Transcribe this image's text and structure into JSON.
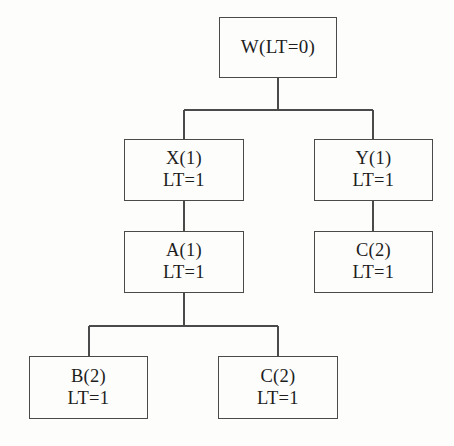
{
  "diagram": {
    "type": "tree",
    "title": "",
    "background_color": "#fdfdfc",
    "line_color": "#4a4a4a",
    "text_color": "#1d1d1d",
    "nodes": [
      {
        "id": "W",
        "line1": "W(LT=0)",
        "line2": "",
        "row": 0,
        "box": {
          "x": 219,
          "y": 17,
          "w": 118,
          "h": 61
        }
      },
      {
        "id": "X",
        "line1": "X(1)",
        "line2": "LT=1",
        "row": 1,
        "box": {
          "x": 124,
          "y": 139,
          "w": 120,
          "h": 62
        }
      },
      {
        "id": "Y",
        "line1": "Y(1)",
        "line2": "LT=1",
        "row": 1,
        "box": {
          "x": 314,
          "y": 139,
          "w": 119,
          "h": 62
        }
      },
      {
        "id": "A",
        "line1": "A(1)",
        "line2": "LT=1",
        "row": 2,
        "box": {
          "x": 124,
          "y": 231,
          "w": 120,
          "h": 62
        }
      },
      {
        "id": "C-right",
        "line1": "C(2)",
        "line2": "LT=1",
        "row": 2,
        "box": {
          "x": 314,
          "y": 231,
          "w": 119,
          "h": 62
        }
      },
      {
        "id": "B",
        "line1": "B(2)",
        "line2": "LT=1",
        "row": 3,
        "box": {
          "x": 29,
          "y": 356,
          "w": 119,
          "h": 63
        }
      },
      {
        "id": "C-bottom",
        "line1": "C(2)",
        "line2": "LT=1",
        "row": 3,
        "box": {
          "x": 218,
          "y": 356,
          "w": 120,
          "h": 63
        }
      }
    ],
    "edges": [
      {
        "from": "W",
        "to": "X",
        "style": "orthogonal"
      },
      {
        "from": "W",
        "to": "Y",
        "style": "orthogonal"
      },
      {
        "from": "X",
        "to": "A",
        "style": "straight"
      },
      {
        "from": "Y",
        "to": "C-right",
        "style": "straight"
      },
      {
        "from": "A",
        "to": "B",
        "style": "orthogonal"
      },
      {
        "from": "A",
        "to": "C-bottom",
        "style": "orthogonal"
      }
    ]
  }
}
